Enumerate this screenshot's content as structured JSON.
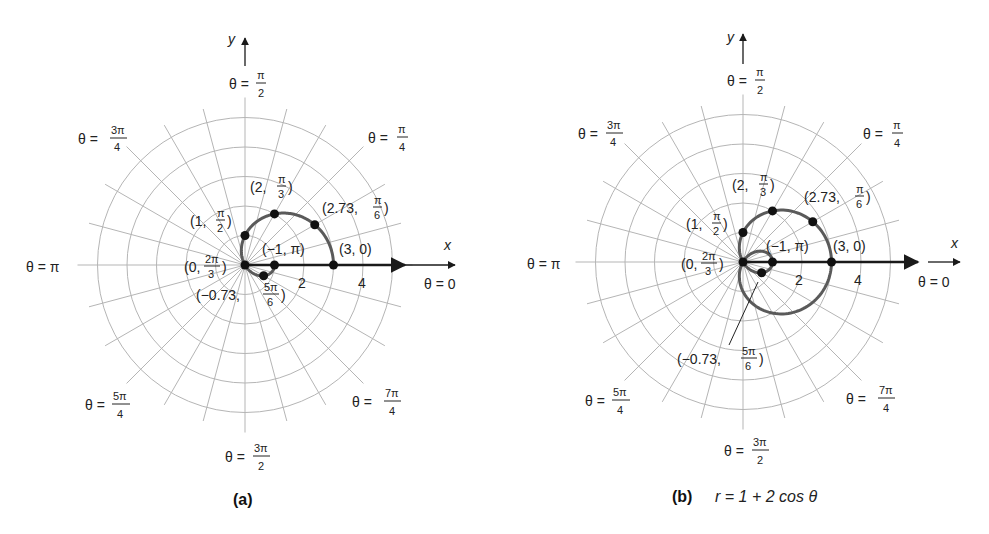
{
  "figure": {
    "panel_a": {
      "caption": "(a)",
      "axis_x_label": "x",
      "axis_y_label": "y",
      "tick_labels": [
        "2",
        "4"
      ],
      "angle_labels": {
        "theta_0": "θ = 0",
        "theta_pi_over_4": {
          "prefix": "θ = ",
          "num": "π",
          "den": "4"
        },
        "theta_pi_over_2": {
          "prefix": "θ = ",
          "num": "π",
          "den": "2"
        },
        "theta_3pi_over_4": {
          "prefix": "θ = ",
          "num": "3π",
          "den": "4"
        },
        "theta_pi": "θ = π",
        "theta_5pi_over_4": {
          "prefix": "θ = ",
          "num": "5π",
          "den": "4"
        },
        "theta_3pi_over_2": {
          "prefix": "θ = ",
          "num": "3π",
          "den": "2"
        },
        "theta_7pi_over_4": {
          "prefix": "θ = ",
          "num": "7π",
          "den": "4"
        }
      },
      "point_labels": [
        {
          "r": "3",
          "theta": "0"
        },
        {
          "r": "2.73",
          "theta_num": "π",
          "theta_den": "6"
        },
        {
          "r": "2",
          "theta_num": "π",
          "theta_den": "3"
        },
        {
          "r": "1",
          "theta_num": "π",
          "theta_den": "2"
        },
        {
          "r": "0",
          "theta_num": "2π",
          "theta_den": "3"
        },
        {
          "r": "−0.73",
          "theta_num": "5π",
          "theta_den": "6"
        },
        {
          "r": "−1",
          "theta": "π"
        }
      ]
    },
    "panel_b": {
      "caption": "(b)",
      "equation": "r = 1 + 2 cos θ",
      "axis_x_label": "x",
      "axis_y_label": "y",
      "tick_labels": [
        "2",
        "4"
      ]
    }
  },
  "chart_data": [
    {
      "type": "scatter",
      "title": "(a)",
      "coordinate_system": "polar",
      "xlabel": "x",
      "ylabel": "y",
      "grid": true,
      "rings": [
        1,
        2,
        3,
        4,
        5
      ],
      "radial_lines_deg_step": 15,
      "axis_ticks": [
        2,
        4
      ],
      "points": [
        {
          "r": 3,
          "theta": "0",
          "theta_rad": 0
        },
        {
          "r": 2.73,
          "theta": "π/6",
          "theta_rad": 0.5236
        },
        {
          "r": 2,
          "theta": "π/3",
          "theta_rad": 1.0472
        },
        {
          "r": 1,
          "theta": "π/2",
          "theta_rad": 1.5708
        },
        {
          "r": 0,
          "theta": "2π/3",
          "theta_rad": 2.0944
        },
        {
          "r": -0.73,
          "theta": "5π/6",
          "theta_rad": 2.618
        },
        {
          "r": -1,
          "theta": "π",
          "theta_rad": 3.1416
        }
      ],
      "curve": "r = 1 + 2 cos θ, 0 ≤ θ ≤ π"
    },
    {
      "type": "line",
      "title": "(b) r = 1 + 2 cos θ",
      "coordinate_system": "polar",
      "xlabel": "x",
      "ylabel": "y",
      "grid": true,
      "rings": [
        1,
        2,
        3,
        4,
        5
      ],
      "radial_lines_deg_step": 15,
      "axis_ticks": [
        2,
        4
      ],
      "equation": "r = 1 + 2 cos θ",
      "theta_range": [
        0,
        6.2832
      ],
      "points": [
        {
          "r": 3,
          "theta": "0"
        },
        {
          "r": 2.73,
          "theta": "π/6"
        },
        {
          "r": 2,
          "theta": "π/3"
        },
        {
          "r": 1,
          "theta": "π/2"
        },
        {
          "r": 0,
          "theta": "2π/3"
        },
        {
          "r": -0.73,
          "theta": "5π/6"
        },
        {
          "r": -1,
          "theta": "π"
        }
      ]
    }
  ]
}
